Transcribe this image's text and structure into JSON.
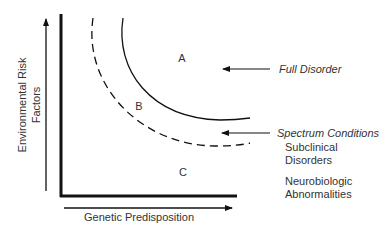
{
  "diagram": {
    "y_axis_label_line1": "Environmental Risk",
    "y_axis_label_line2": "Factors",
    "x_axis_label": "Genetic Predisposition",
    "regions": {
      "a": "A",
      "b": "B",
      "c": "C"
    },
    "annotations": {
      "full_disorder": "Full Disorder",
      "spectrum_conditions": "Spectrum Conditions",
      "subclinical_line1": "Subclinical",
      "subclinical_line2": "Disorders",
      "neuro_line1": "Neurobiologic",
      "neuro_line2": "Abnormalities"
    },
    "colors": {
      "line": "#111111",
      "text": "#333333"
    }
  }
}
